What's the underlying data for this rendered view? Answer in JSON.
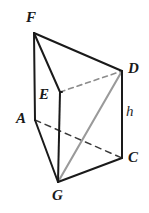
{
  "figure": {
    "canvas": {
      "width": 149,
      "height": 213,
      "background": "#ffffff"
    },
    "colors": {
      "edge_solid": "#1a1a1a",
      "edge_hidden": "#8c8c8c",
      "diagonal": "#9a9a9a",
      "label_text": "#1a1a1a"
    },
    "vertices": [
      {
        "name": "F",
        "x": 34,
        "y": 33,
        "label": "F",
        "label_x": 26,
        "label_y": 10
      },
      {
        "name": "D",
        "x": 122,
        "y": 71,
        "label": "D",
        "label_x": 128,
        "label_y": 61
      },
      {
        "name": "E",
        "x": 60,
        "y": 92,
        "label": "E",
        "label_x": 39,
        "label_y": 87
      },
      {
        "name": "A",
        "x": 35,
        "y": 120,
        "label": "A",
        "label_x": 16,
        "label_y": 111
      },
      {
        "name": "C",
        "x": 122,
        "y": 158,
        "label": "C",
        "label_x": 128,
        "label_y": 150
      },
      {
        "name": "G",
        "x": 58,
        "y": 182,
        "label": "G",
        "label_x": 52,
        "label_y": 188
      }
    ],
    "dimension_labels": [
      {
        "name": "h",
        "text": "h",
        "x": 126,
        "y": 104
      }
    ],
    "edges": [
      {
        "name": "edge-F-D",
        "from": "F",
        "to": "D",
        "style": "solid",
        "width": 2.0,
        "color": "#1a1a1a"
      },
      {
        "name": "edge-F-E",
        "from": "F",
        "to": "E",
        "style": "solid",
        "width": 2.0,
        "color": "#1a1a1a"
      },
      {
        "name": "edge-F-A",
        "from": "F",
        "to": "A",
        "style": "solid",
        "width": 2.0,
        "color": "#1a1a1a"
      },
      {
        "name": "edge-E-D",
        "from": "E",
        "to": "D",
        "style": "dashed",
        "width": 1.6,
        "color": "#8c8c8c"
      },
      {
        "name": "edge-E-G",
        "from": "E",
        "to": "G",
        "style": "solid",
        "width": 2.0,
        "color": "#1a1a1a"
      },
      {
        "name": "edge-A-C",
        "from": "A",
        "to": "C",
        "style": "dashed",
        "width": 1.6,
        "color": "#3a3a3a"
      },
      {
        "name": "edge-A-G",
        "from": "A",
        "to": "G",
        "style": "solid",
        "width": 2.0,
        "color": "#1a1a1a"
      },
      {
        "name": "edge-G-C",
        "from": "G",
        "to": "C",
        "style": "solid",
        "width": 2.0,
        "color": "#1a1a1a"
      },
      {
        "name": "edge-D-C",
        "from": "D",
        "to": "C",
        "style": "solid",
        "width": 2.0,
        "color": "#1a1a1a"
      },
      {
        "name": "diagonal-G-D",
        "from": "G",
        "to": "D",
        "style": "solid",
        "width": 2.0,
        "color": "#9a9a9a"
      }
    ]
  }
}
